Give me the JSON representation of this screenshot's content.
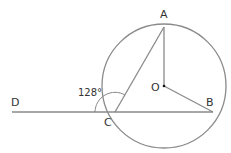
{
  "diagram": {
    "type": "geometry-circle",
    "stroke_color": "#8a8a8a",
    "label_color": "#333333",
    "circle": {
      "center": "O",
      "cx": 164,
      "cy": 86,
      "r": 62
    },
    "points": {
      "A": {
        "label": "A",
        "x": 164,
        "y": 25
      },
      "B": {
        "label": "B",
        "x": 213,
        "y": 112
      },
      "C": {
        "label": "C",
        "x": 115,
        "y": 112
      },
      "D": {
        "label": "D",
        "x": 12,
        "y": 112
      },
      "O": {
        "label": "O",
        "x": 164,
        "y": 86
      }
    },
    "segments": [
      "D-B",
      "C-A",
      "A-O",
      "O-B"
    ],
    "angle": {
      "vertex": "C",
      "between": [
        "D",
        "A"
      ],
      "label": "128°"
    }
  }
}
